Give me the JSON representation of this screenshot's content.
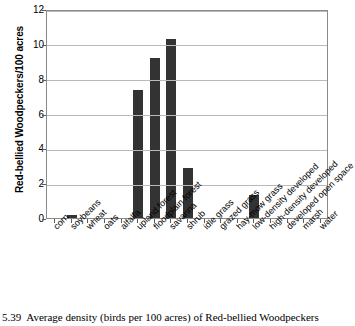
{
  "chart_data": {
    "type": "bar",
    "title": "",
    "xlabel": "",
    "ylabel": "Red-bellied Woodpeckers/100 acres",
    "ylim": [
      0,
      12
    ],
    "ytick_labels": [
      "0",
      "2",
      "4",
      "6",
      "8",
      "10",
      "12"
    ],
    "ytick_values": [
      0,
      2,
      4,
      6,
      8,
      10,
      12
    ],
    "grid": true,
    "legend": false,
    "bar_color": "#333333",
    "categories": [
      "corn",
      "soybeans",
      "wheat",
      "oats",
      "alfalfa",
      "upland forest",
      "floodplain forest",
      "savanna",
      "shrub",
      "idle grass",
      "grazed grass",
      "hay-mow grass",
      "low-density developed",
      "high-density developed",
      "developed open space",
      "marsh",
      "water"
    ],
    "values": [
      0,
      0.2,
      0,
      0,
      0,
      7.35,
      9.2,
      10.3,
      2.85,
      0,
      0,
      0,
      1.3,
      0,
      0,
      0,
      0
    ]
  },
  "caption": {
    "number": "5.39",
    "text": "Average density (birds per 100 acres) of Red-bellied Woodpeckers"
  }
}
